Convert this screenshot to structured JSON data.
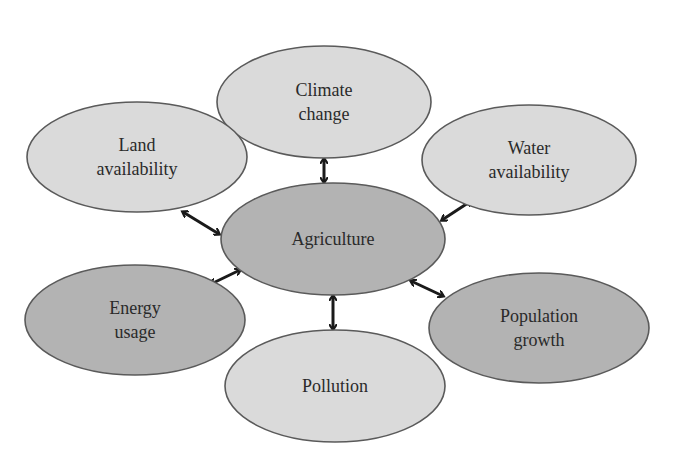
{
  "diagram": {
    "center": {
      "id": "agriculture",
      "lines": [
        "Agriculture"
      ],
      "cx": 333,
      "cy": 239,
      "rx": 112,
      "ry": 56,
      "shade": "dark"
    },
    "nodes": [
      {
        "id": "climate-change",
        "lines": [
          "Climate",
          "change"
        ],
        "cx": 324,
        "cy": 102,
        "rx": 107,
        "ry": 56,
        "shade": "light"
      },
      {
        "id": "land-availability",
        "lines": [
          "Land",
          "availability"
        ],
        "cx": 137,
        "cy": 157,
        "rx": 110,
        "ry": 55,
        "shade": "light"
      },
      {
        "id": "water-availability",
        "lines": [
          "Water",
          "availability"
        ],
        "cx": 529,
        "cy": 160,
        "rx": 107,
        "ry": 55,
        "shade": "light"
      },
      {
        "id": "energy-usage",
        "lines": [
          "Energy",
          "usage"
        ],
        "cx": 135,
        "cy": 320,
        "rx": 110,
        "ry": 55,
        "shade": "dark"
      },
      {
        "id": "population-growth",
        "lines": [
          "Population",
          "growth"
        ],
        "cx": 539,
        "cy": 328,
        "rx": 110,
        "ry": 55,
        "shade": "dark"
      },
      {
        "id": "pollution",
        "lines": [
          "Pollution"
        ],
        "cx": 335,
        "cy": 386,
        "rx": 110,
        "ry": 56,
        "shade": "light"
      }
    ],
    "connectors": [
      {
        "from": "agriculture",
        "to": "climate-change",
        "x1": 324,
        "y1": 182,
        "x2": 324,
        "y2": 159,
        "type": "bidirectional"
      },
      {
        "from": "agriculture",
        "to": "land-availability",
        "x1": 219,
        "y1": 234,
        "x2": 183,
        "y2": 212,
        "type": "bidirectional"
      },
      {
        "from": "agriculture",
        "to": "water-availability",
        "x1": 442,
        "y1": 220,
        "x2": 471,
        "y2": 201,
        "type": "bidirectional"
      },
      {
        "from": "agriculture",
        "to": "energy-usage",
        "x1": 240,
        "y1": 270,
        "x2": 211,
        "y2": 284,
        "type": "bidirectional"
      },
      {
        "from": "agriculture",
        "to": "population-growth",
        "x1": 411,
        "y1": 281,
        "x2": 443,
        "y2": 296,
        "type": "bidirectional"
      },
      {
        "from": "agriculture",
        "to": "pollution",
        "x1": 333,
        "y1": 296,
        "x2": 333,
        "y2": 329,
        "type": "bidirectional"
      }
    ],
    "colors": {
      "light_fill": "#dadada",
      "dark_fill": "#b3b3b3",
      "stroke": "#5a5a5a",
      "arrow": "#1a1a1a",
      "text": "#2a2a2a"
    }
  }
}
